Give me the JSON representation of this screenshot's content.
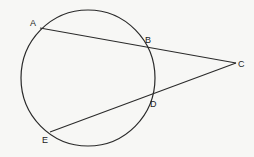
{
  "diagram": {
    "type": "circle-with-two-secants",
    "circle": {
      "cx": 88,
      "cy": 78,
      "rx": 67,
      "ry": 68
    },
    "points": [
      {
        "id": "A",
        "x": 40,
        "y": 28,
        "label": "A",
        "lx": 30,
        "ly": 26
      },
      {
        "id": "B",
        "x": 147,
        "y": 47,
        "label": "B",
        "lx": 145,
        "ly": 43
      },
      {
        "id": "C",
        "x": 236,
        "y": 63,
        "label": "C",
        "lx": 238,
        "ly": 67
      },
      {
        "id": "D",
        "x": 152,
        "y": 96,
        "label": "D",
        "lx": 150,
        "ly": 107
      },
      {
        "id": "E",
        "x": 50,
        "y": 132,
        "label": "E",
        "lx": 42,
        "ly": 143
      }
    ],
    "segments": [
      {
        "from": "A",
        "to": "C"
      },
      {
        "from": "E",
        "to": "C"
      }
    ],
    "stroke_color": "#2a2a2a",
    "background_color": "#f7f7f5"
  }
}
